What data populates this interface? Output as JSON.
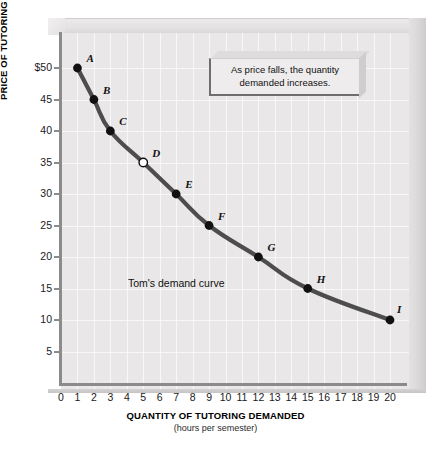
{
  "chart_data": {
    "type": "line",
    "title": "",
    "xlabel": "QUANTITY OF TUTORING DEMANDED",
    "xsublabel": "(hours per semester)",
    "ylabel": "PRICE OF TUTORING",
    "ysublabel": "(dollars per hour)",
    "xlim": [
      0,
      20
    ],
    "ylim": [
      0,
      52
    ],
    "xticks": [
      "0",
      "1",
      "2",
      "3",
      "4",
      "5",
      "6",
      "7",
      "8",
      "9",
      "10",
      "11",
      "12",
      "13",
      "14",
      "15",
      "16",
      "17",
      "18",
      "19",
      "20"
    ],
    "yticks": [
      "$50",
      "45",
      "40",
      "35",
      "30",
      "25",
      "20",
      "15",
      "10",
      "5"
    ],
    "ytick_values": [
      50,
      45,
      40,
      35,
      30,
      25,
      20,
      15,
      10,
      5
    ],
    "grid": true,
    "legend": "none",
    "series_name": "Tom's demand curve",
    "points": [
      {
        "label": "A",
        "x": 1,
        "y": 50,
        "marker": "filled",
        "label_dx": 9,
        "label_dy": -16
      },
      {
        "label": "B",
        "x": 2,
        "y": 45,
        "marker": "filled",
        "label_dx": 9,
        "label_dy": -16
      },
      {
        "label": "C",
        "x": 3,
        "y": 40,
        "marker": "filled",
        "label_dx": 9,
        "label_dy": -16
      },
      {
        "label": "D",
        "x": 5,
        "y": 35,
        "marker": "open",
        "label_dx": 9,
        "label_dy": -16
      },
      {
        "label": "E",
        "x": 7,
        "y": 30,
        "marker": "filled",
        "label_dx": 9,
        "label_dy": -16
      },
      {
        "label": "F",
        "x": 9,
        "y": 25,
        "marker": "filled",
        "label_dx": 9,
        "label_dy": -16
      },
      {
        "label": "G",
        "x": 12,
        "y": 20,
        "marker": "filled",
        "label_dx": 9,
        "label_dy": -16
      },
      {
        "label": "H",
        "x": 15,
        "y": 15,
        "marker": "filled",
        "label_dx": 9,
        "label_dy": -16
      },
      {
        "label": "I",
        "x": 20,
        "y": 10,
        "marker": "filled",
        "label_dx": 7,
        "label_dy": -17
      }
    ],
    "annotations": [
      {
        "name": "callout",
        "text": "As price falls, the quantity demanded increases."
      },
      {
        "name": "curve-label",
        "text": "Tom's demand curve"
      }
    ],
    "colors": {
      "curve": "#4d4d4d",
      "panel_background": "#e9e7e7",
      "gridline": "#ffffff",
      "axis": "#8b8b8b",
      "marker_fill": "#111111",
      "marker_open_fill": "#ffffff",
      "page_background": "#ffffff"
    }
  },
  "axis": {
    "y_title_main": "PRICE OF TUTORING",
    "y_title_sub": " (dollars per hour)",
    "x_title_main": "QUANTITY OF TUTORING DEMANDED",
    "x_title_sub": "(hours per semester)"
  },
  "callout": {
    "line1": "As price falls, the quantity",
    "line2": "demanded increases."
  },
  "curve": {
    "name": "Tom's demand curve"
  }
}
